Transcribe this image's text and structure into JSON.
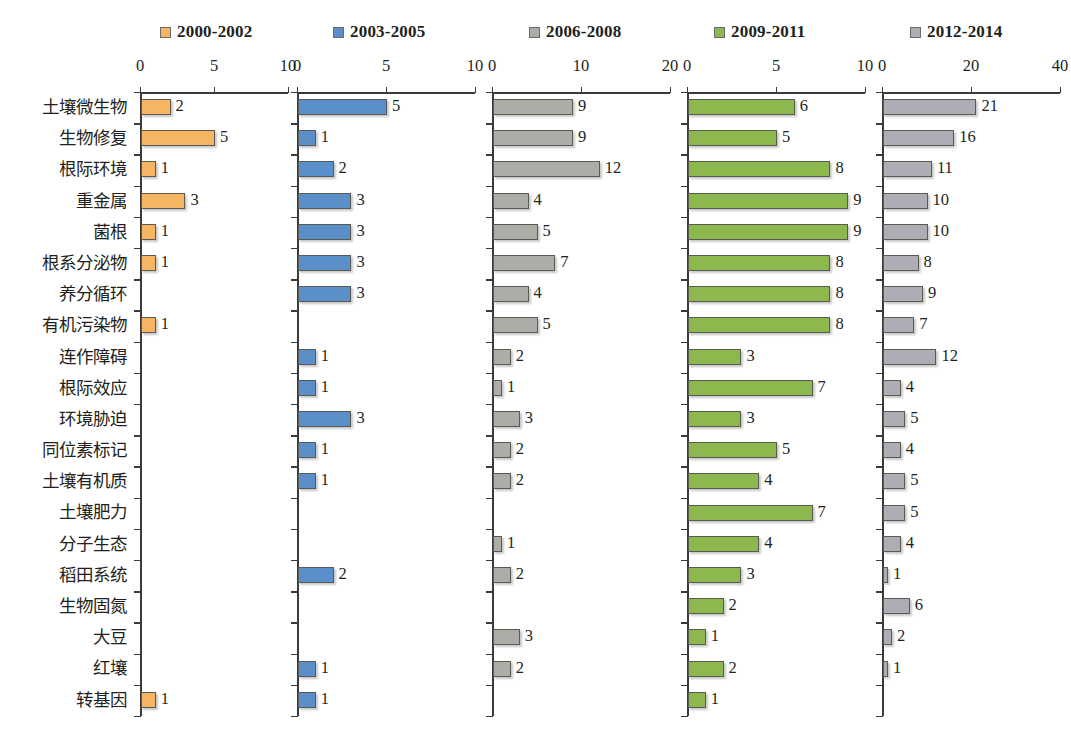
{
  "legend": {
    "items": [
      {
        "label": "2000-2002",
        "color": "#F5B563",
        "left_px": 160
      },
      {
        "label": "2003-2005",
        "color": "#5B8FC9",
        "left_px": 333
      },
      {
        "label": "2006-2008",
        "color": "#ADADA8",
        "left_px": 529
      },
      {
        "label": "2009-2011",
        "color": "#8DB84E",
        "left_px": 714
      },
      {
        "label": "2012-2014",
        "color": "#B0ACB6",
        "left_px": 910
      }
    ]
  },
  "chart_data": {
    "type": "bar",
    "title": "",
    "xlabel": "",
    "ylabel": "",
    "grid": false,
    "legend_position": "top",
    "orientation": "horizontal",
    "layout": "small-multiples, 5 panels sharing category axis",
    "categories": [
      "土壤微生物",
      "生物修复",
      "根际环境",
      "重金属",
      "菌根",
      "根系分泌物",
      "养分循环",
      "有机污染物",
      "连作障碍",
      "根际效应",
      "环境胁迫",
      "同位素标记",
      "土壤有机质",
      "土壤肥力",
      "分子生态",
      "稻田系统",
      "生物固氮",
      "大豆",
      "红壤",
      "转基因"
    ],
    "series": [
      {
        "name": "2000-2002",
        "color": "#F5B563",
        "xlim": [
          0,
          10
        ],
        "xticks": [
          0,
          5,
          10
        ],
        "values": [
          2,
          5,
          1,
          3,
          1,
          1,
          null,
          1,
          null,
          null,
          null,
          null,
          null,
          null,
          null,
          null,
          null,
          null,
          null,
          1
        ]
      },
      {
        "name": "2003-2005",
        "color": "#5B8FC9",
        "xlim": [
          0,
          10
        ],
        "xticks": [
          0,
          5,
          10
        ],
        "values": [
          5,
          1,
          2,
          3,
          3,
          3,
          3,
          null,
          1,
          1,
          3,
          1,
          1,
          null,
          null,
          2,
          null,
          null,
          1,
          1
        ]
      },
      {
        "name": "2006-2008",
        "color": "#ADADA8",
        "xlim": [
          0,
          20
        ],
        "xticks": [
          0,
          10,
          20
        ],
        "values": [
          9,
          9,
          12,
          4,
          5,
          7,
          4,
          5,
          2,
          1,
          3,
          2,
          2,
          null,
          1,
          2,
          null,
          3,
          2,
          null
        ]
      },
      {
        "name": "2009-2011",
        "color": "#8DB84E",
        "xlim": [
          0,
          10
        ],
        "xticks": [
          0,
          5,
          10
        ],
        "values": [
          6,
          5,
          8,
          9,
          9,
          8,
          8,
          8,
          3,
          7,
          3,
          5,
          4,
          7,
          4,
          3,
          2,
          1,
          2,
          1
        ]
      },
      {
        "name": "2012-2014",
        "color": "#B0ACB6",
        "xlim": [
          0,
          40
        ],
        "xticks": [
          0,
          20,
          40
        ],
        "values": [
          21,
          16,
          11,
          10,
          10,
          8,
          9,
          7,
          12,
          4,
          5,
          4,
          5,
          5,
          4,
          1,
          6,
          2,
          1,
          null
        ]
      }
    ]
  },
  "panels_geometry": [
    {
      "left": 140,
      "width": 148
    },
    {
      "left": 297,
      "width": 178
    },
    {
      "left": 492,
      "width": 178
    },
    {
      "left": 687,
      "width": 178
    },
    {
      "left": 882,
      "width": 178
    }
  ]
}
